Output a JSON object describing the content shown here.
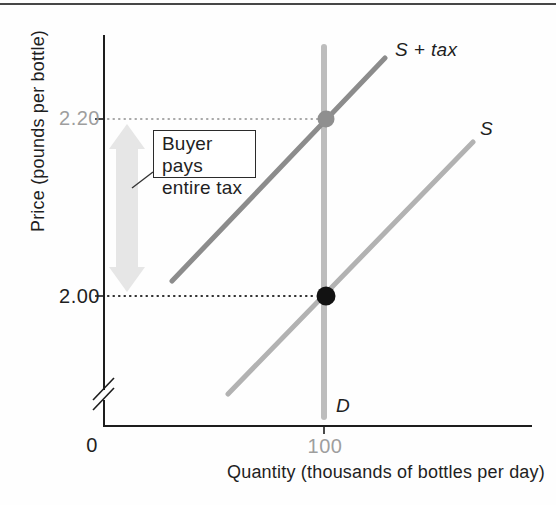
{
  "chart_data": {
    "type": "line",
    "title": "",
    "xlabel": "Quantity (thousands of bottles per day)",
    "ylabel": "Price (pounds per bottle)",
    "x_ticks_shown": [
      0,
      100
    ],
    "y_ticks_shown": [
      2.0,
      2.2
    ],
    "axis_break_on_y": true,
    "grid": false,
    "series": [
      {
        "name": "S",
        "role": "supply",
        "points": [
          [
            56,
            1.89
          ],
          [
            166,
            2.17
          ]
        ]
      },
      {
        "name": "S + tax",
        "role": "supply-plus-tax",
        "points": [
          [
            31,
            2.02
          ],
          [
            127,
            2.27
          ]
        ]
      },
      {
        "name": "D",
        "role": "demand",
        "points": [
          [
            100,
            1.86
          ],
          [
            100,
            2.28
          ]
        ]
      }
    ],
    "key_points": [
      {
        "label": "pre-tax equilibrium",
        "quantity": 100,
        "price": 2.0
      },
      {
        "label": "post-tax buyer price",
        "quantity": 100,
        "price": 2.2
      }
    ],
    "tax_per_unit": 0.2,
    "annotation": "Buyer pays entire tax"
  },
  "axes": {
    "y_label": "Price (pounds per bottle)",
    "x_label": "Quantity (thousands of bottles per day)",
    "tick_220": "2.20",
    "tick_200": "2.00",
    "tick_0": "0",
    "tick_100": "100"
  },
  "curve_labels": {
    "s_plus_tax": "S + tax",
    "s": "S",
    "d": "D"
  },
  "annotation_box": {
    "line1": "Buyer pays",
    "line2": "entire tax"
  },
  "colors": {
    "ink": "#1f1f1f",
    "muted_label": "#9e9e9e",
    "top_rule": "#474747",
    "s_plus_tax_curve": "#8c8c8c",
    "s_curve": "#b2b2b2",
    "d_curve": "#bdbdbd",
    "gray_point": "#8f8f8f",
    "black_point": "#121212",
    "tax_arrow": "#e6e6e6"
  },
  "geometry": {
    "width": 556,
    "height": 505,
    "arrow": {
      "points": "127,124 145,149 138,149 138,267 145,267 127,292 109,267 116,267 116,149 109,149",
      "color": "#e6e6e6"
    },
    "dotted": [
      {
        "name": "price-220-dotted-line",
        "x1": 108,
        "y1": 119,
        "x2": 318,
        "y2": 119,
        "color": "#a8a8a8"
      },
      {
        "name": "price-200-dotted-line",
        "x1": 108,
        "y1": 296,
        "x2": 315,
        "y2": 296,
        "color": "#2e2e2e"
      }
    ],
    "curves": [
      {
        "name": "demand-curve",
        "x1": 324,
        "y1": 47,
        "x2": 324,
        "y2": 417,
        "color": "#bdbdbd",
        "width": 6
      },
      {
        "name": "s-plus-tax-curve",
        "x1": 172,
        "y1": 281,
        "x2": 385,
        "y2": 58,
        "color": "#8c8c8c",
        "width": 5
      },
      {
        "name": "supply-curve",
        "x1": 228,
        "y1": 394,
        "x2": 473,
        "y2": 142,
        "color": "#b2b2b2",
        "width": 5
      }
    ],
    "points": [
      {
        "name": "post-tax-point",
        "cx": 326,
        "cy": 119,
        "r": 8.5,
        "color": "#8f8f8f"
      },
      {
        "name": "equilibrium-point",
        "cx": 326,
        "cy": 296,
        "r": 9.5,
        "color": "#121212"
      }
    ],
    "axis": {
      "color": "#1d1d1d",
      "segments": [
        {
          "name": "y-axis-upper",
          "x1": 104,
          "y1": 35,
          "x2": 104,
          "y2": 390,
          "w": 2
        },
        {
          "name": "y-axis-lower",
          "x1": 104,
          "y1": 400,
          "x2": 104,
          "y2": 426,
          "w": 2
        },
        {
          "name": "x-axis",
          "x1": 103,
          "y1": 426,
          "x2": 532,
          "y2": 426,
          "w": 2
        }
      ],
      "break_slashes": [
        {
          "x1": 93,
          "y1": 400,
          "x2": 114,
          "y2": 378
        },
        {
          "x1": 93,
          "y1": 410,
          "x2": 114,
          "y2": 388
        }
      ],
      "ticks": [
        {
          "name": "tick-220",
          "x1": 95,
          "y1": 119,
          "x2": 104,
          "y2": 119
        },
        {
          "name": "tick-200",
          "x1": 95,
          "y1": 296,
          "x2": 104,
          "y2": 296
        },
        {
          "name": "tick-100",
          "x1": 324,
          "y1": 427,
          "x2": 324,
          "y2": 434
        }
      ]
    },
    "leader": {
      "x1": 132,
      "y1": 188,
      "x2": 153,
      "y2": 172,
      "color": "#333333"
    }
  }
}
